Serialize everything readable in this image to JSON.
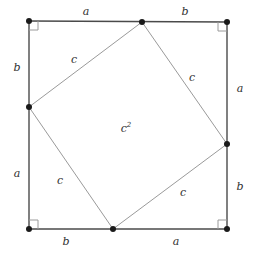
{
  "figure": {
    "kind": "geometry-diagram",
    "canvas": {
      "width": 253,
      "height": 257,
      "background": "#ffffff"
    },
    "colors": {
      "outer_stroke": "#4a4a4a",
      "inner_stroke": "#9a9a9a",
      "vertex_fill": "#1a1a1a",
      "label_text": "#303030",
      "right_angle_stroke": "#9a9a9a"
    },
    "outer_square": {
      "name": "outer-square",
      "stroke_width": 1.4,
      "corners": [
        {
          "name": "top-left",
          "x": 29,
          "y": 21
        },
        {
          "name": "top-right",
          "x": 227,
          "y": 22
        },
        {
          "name": "bottom-right",
          "x": 227,
          "y": 229
        },
        {
          "name": "bottom-left",
          "x": 29,
          "y": 229
        }
      ]
    },
    "inner_square": {
      "name": "inner-square",
      "stroke_width": 1.0,
      "vertices": [
        {
          "name": "top",
          "x": 142,
          "y": 22
        },
        {
          "name": "right",
          "x": 227,
          "y": 144
        },
        {
          "name": "bottom",
          "x": 113,
          "y": 229
        },
        {
          "name": "left",
          "x": 29,
          "y": 107
        }
      ]
    },
    "vertex_dots": [
      {
        "name": "dot-outer-top-left",
        "x": 29,
        "y": 21,
        "r": 3.0
      },
      {
        "name": "dot-outer-top-right",
        "x": 227,
        "y": 22,
        "r": 3.0
      },
      {
        "name": "dot-outer-bottom-right",
        "x": 227,
        "y": 229,
        "r": 3.0
      },
      {
        "name": "dot-outer-bottom-left",
        "x": 29,
        "y": 229,
        "r": 3.0
      },
      {
        "name": "dot-inner-top",
        "x": 142,
        "y": 22,
        "r": 3.0
      },
      {
        "name": "dot-inner-right",
        "x": 227,
        "y": 144,
        "r": 3.0
      },
      {
        "name": "dot-inner-bottom",
        "x": 113,
        "y": 229,
        "r": 3.0
      },
      {
        "name": "dot-inner-left",
        "x": 29,
        "y": 107,
        "r": 3.0
      }
    ],
    "right_angle_markers": [
      {
        "name": "right-angle-top-left",
        "corner_x": 29,
        "corner_y": 21,
        "dx": 1,
        "dy": 1,
        "size": 9
      },
      {
        "name": "right-angle-top-right",
        "corner_x": 227,
        "corner_y": 22,
        "dx": -1,
        "dy": 1,
        "size": 9
      },
      {
        "name": "right-angle-bottom-right",
        "corner_x": 227,
        "corner_y": 229,
        "dx": -1,
        "dy": -1,
        "size": 9
      },
      {
        "name": "right-angle-bottom-left",
        "corner_x": 29,
        "corner_y": 229,
        "dx": 1,
        "dy": -1,
        "size": 9
      }
    ],
    "labels": [
      {
        "name": "label-top-a",
        "text": "a",
        "sup": "",
        "x": 86,
        "y": 11,
        "edge": "top",
        "side": "left"
      },
      {
        "name": "label-top-b",
        "text": "b",
        "sup": "",
        "x": 185,
        "y": 11,
        "edge": "top",
        "side": "right"
      },
      {
        "name": "label-right-a",
        "text": "a",
        "sup": "",
        "x": 240,
        "y": 88,
        "edge": "right",
        "side": "top"
      },
      {
        "name": "label-right-b",
        "text": "b",
        "sup": "",
        "x": 240,
        "y": 186,
        "edge": "right",
        "side": "bottom"
      },
      {
        "name": "label-bottom-b",
        "text": "b",
        "sup": "",
        "x": 66,
        "y": 241,
        "edge": "bottom",
        "side": "left"
      },
      {
        "name": "label-bottom-a",
        "text": "a",
        "sup": "",
        "x": 176,
        "y": 241,
        "edge": "bottom",
        "side": "right"
      },
      {
        "name": "label-left-b",
        "text": "b",
        "sup": "",
        "x": 17,
        "y": 67,
        "edge": "left",
        "side": "top"
      },
      {
        "name": "label-left-a",
        "text": "a",
        "sup": "",
        "x": 17,
        "y": 173,
        "edge": "left",
        "side": "bottom"
      },
      {
        "name": "label-hyp-top-left",
        "text": "c",
        "sup": "",
        "x": 74,
        "y": 59,
        "edge": "inner",
        "side": "top-left"
      },
      {
        "name": "label-hyp-top-right",
        "text": "c",
        "sup": "",
        "x": 192,
        "y": 77,
        "edge": "inner",
        "side": "top-right"
      },
      {
        "name": "label-hyp-bottom-left",
        "text": "c",
        "sup": "",
        "x": 60,
        "y": 180,
        "edge": "inner",
        "side": "bottom-left"
      },
      {
        "name": "label-hyp-bottom-right",
        "text": "c",
        "sup": "",
        "x": 183,
        "y": 192,
        "edge": "inner",
        "side": "bottom-right"
      },
      {
        "name": "label-inner-area",
        "text": "c",
        "sup": "2",
        "x": 126,
        "y": 128,
        "edge": "inner",
        "side": "center"
      }
    ]
  }
}
